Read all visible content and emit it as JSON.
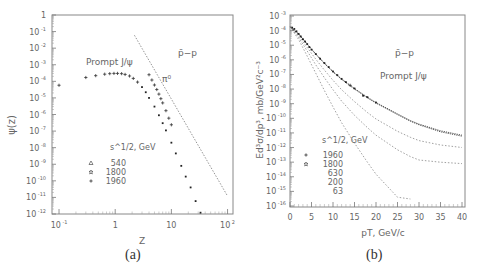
{
  "panels": [
    {
      "caption": "(a)"
    },
    {
      "caption": "(b)"
    }
  ],
  "chart_data": [
    {
      "type": "scatter",
      "panel": "(a)",
      "title": "",
      "xlabel": "Z",
      "ylabel": "ψ(z)",
      "xscale": "log",
      "yscale": "log",
      "xlim": [
        0.075,
        125
      ],
      "ylim": [
        1e-12,
        1
      ],
      "xticks": [
        "10^-1",
        "1",
        "10",
        "10^2"
      ],
      "yticks": [
        "1",
        "10^-1",
        "10^-2",
        "10^-3",
        "10^-4",
        "10^-5",
        "10^-6",
        "10^-7",
        "10^-8",
        "10^-9",
        "10^-10",
        "10^-11",
        "10^-12"
      ],
      "annotations": [
        "p̄−p",
        "Prompt J/ψ",
        "π⁰"
      ],
      "legend_title": "s^1/2, GeV",
      "legend": [
        {
          "marker": "triangle",
          "label": "540"
        },
        {
          "marker": "star",
          "label": "1800"
        },
        {
          "marker": "plus",
          "label": "1960"
        }
      ],
      "series": [
        {
          "name": "Prompt J/ψ (data)",
          "style": "points",
          "x": [
            0.1,
            0.3,
            0.45,
            0.65,
            0.8,
            0.95,
            1.1,
            1.3,
            1.5,
            1.8,
            2.1,
            2.5,
            3.0,
            3.5,
            4.0,
            5.0,
            6.0,
            7.0,
            8.0,
            10.0,
            12.0,
            15.0,
            18.0,
            22.0,
            27.0,
            33.0
          ],
          "y": [
            5.8e-05,
            0.00017,
            0.00022,
            0.00027,
            0.00029,
            0.0003,
            0.0003,
            0.00029,
            0.00026,
            0.00021,
            0.00015,
            9e-05,
            4.5e-05,
            2.2e-05,
            1e-05,
            3e-06,
            9e-07,
            3e-07,
            1.1e-07,
            2e-08,
            4.5e-09,
            8e-10,
            1.8e-10,
            4e-11,
            6e-12,
            1.2e-12
          ]
        },
        {
          "name": "π⁰ (data)",
          "style": "points",
          "x": [
            4.0,
            4.5,
            5.0,
            5.5,
            6.0,
            6.5,
            7.0,
            8.0,
            9.0,
            10.0
          ],
          "y": [
            0.00025,
            0.00012,
            6e-05,
            3.2e-05,
            1.7e-05,
            9e-06,
            5e-06,
            1.7e-06,
            6e-07,
            2.4e-07
          ]
        },
        {
          "name": "π⁰ fit",
          "style": "dashed",
          "x": [
            2.2,
            100
          ],
          "y": [
            0.06,
            1.2e-11
          ]
        }
      ]
    },
    {
      "type": "line",
      "panel": "(b)",
      "title": "",
      "xlabel": "pT, GeV/c",
      "ylabel": "Ed³σ/dp³, mb/GeV²c⁻³",
      "xscale": "linear",
      "yscale": "log",
      "xlim": [
        0,
        40
      ],
      "ylim": [
        1e-16,
        0.001
      ],
      "xticks": [
        "0",
        "5",
        "10",
        "15",
        "20",
        "25",
        "30",
        "35",
        "40"
      ],
      "yticks": [
        "10^-3",
        "10^-4",
        "10^-5",
        "10^-6",
        "10^-7",
        "10^-8",
        "10^-9",
        "10^-10",
        "10^-11",
        "10^-12",
        "10^-13",
        "10^-14",
        "10^-15",
        "10^-16"
      ],
      "annotations": [
        "p̄−p",
        "Prompt J/ψ"
      ],
      "legend_title": "s^1/2, GeV",
      "legend": [
        {
          "marker": "plus",
          "label": "1960"
        },
        {
          "marker": "star",
          "label": "1800"
        },
        {
          "marker": "none",
          "label": "630"
        },
        {
          "marker": "none",
          "label": "200"
        },
        {
          "marker": "none",
          "label": "63"
        }
      ],
      "x": [
        0,
        2,
        4,
        6,
        8,
        10,
        12,
        15,
        18,
        20,
        25,
        28,
        30,
        35,
        40
      ],
      "series": [
        {
          "name": "1960",
          "style": "dotted-dense",
          "values": [
            0.00018,
            6e-05,
            1.2e-05,
            2.5e-06,
            6e-07,
            1.6e-07,
            5e-08,
            1.1e-08,
            2.8e-09,
            1.2e-09,
            2e-10,
            7e-11,
            4e-11,
            1.4e-11,
            7e-12
          ]
        },
        {
          "name": "1800",
          "style": "dotted-dense",
          "values": [
            0.00018,
            5.8e-05,
            1.15e-05,
            2.4e-06,
            5.6e-07,
            1.5e-07,
            4.6e-08,
            1e-08,
            2.5e-09,
            1.1e-09,
            1.8e-10,
            6.3e-11,
            3.6e-11,
            1.2e-11,
            6e-12
          ]
        },
        {
          "name": "630",
          "style": "dashed",
          "values": [
            0.00018,
            4.5e-05,
            7e-06,
            1.1e-06,
            2e-07,
            4e-08,
            9e-09,
            1.4e-09,
            2.5e-10,
            9e-11,
            1.3e-11,
            5e-12,
            3e-12,
            1.5e-12,
            1e-12
          ]
        },
        {
          "name": "200",
          "style": "dashed",
          "values": [
            0.00018,
            3.5e-05,
            4e-06,
            4.5e-07,
            6e-08,
            9e-09,
            1.5e-09,
            1.6e-10,
            2.3e-11,
            7e-12,
            7e-13,
            2.4e-13,
            1.4e-13,
            1e-13,
            8e-14
          ]
        },
        {
          "name": "63",
          "style": "dashed",
          "values": [
            0.00018,
            2.5e-05,
            1.8e-06,
            1.2e-07,
            8e-09,
            6e-10,
            5e-11,
            2e-12,
            1e-13,
            1.5e-14,
            4e-16,
            3e-16,
            null,
            null,
            null
          ]
        }
      ],
      "data_points": {
        "name": "1960/1800 data",
        "x": [
          0.5,
          1,
          1.5,
          2,
          2.5,
          3,
          3.5,
          4,
          4.5,
          5,
          6,
          7,
          8,
          9,
          10,
          11,
          12,
          13,
          14,
          15,
          17,
          18,
          20
        ],
        "y": [
          0.00016,
          0.00013,
          9e-05,
          6e-05,
          4e-05,
          2.6e-05,
          1.8e-05,
          1.2e-05,
          7.5e-06,
          5e-06,
          2.5e-06,
          1.2e-06,
          6e-07,
          3.2e-07,
          1.6e-07,
          9e-08,
          5e-08,
          3e-08,
          1.8e-08,
          1.1e-08,
          3.5e-09,
          2.8e-09,
          1.2e-09
        ]
      }
    }
  ]
}
